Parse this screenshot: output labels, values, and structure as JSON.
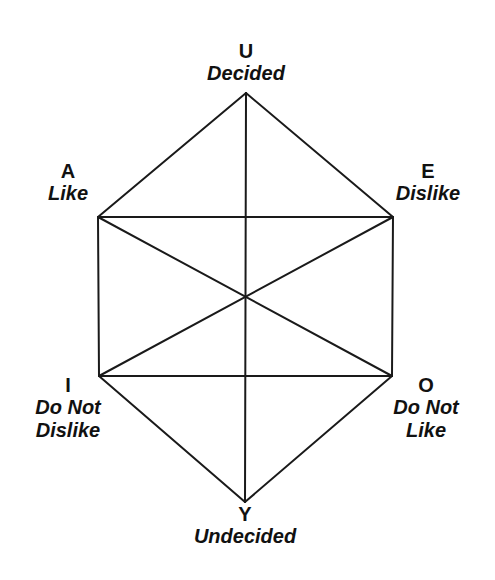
{
  "diagram": {
    "type": "hexagon of opposition",
    "line_color": "#1a1a1a",
    "background": "#ffffff",
    "vertices": {
      "U": {
        "letter": "U",
        "meaning": "Decided",
        "x": 246,
        "y": 93
      },
      "A": {
        "letter": "A",
        "meaning": "Like",
        "x": 98,
        "y": 217
      },
      "E": {
        "letter": "E",
        "meaning": "Dislike",
        "x": 393,
        "y": 217
      },
      "I": {
        "letter": "I",
        "meaning_line1": "Do Not",
        "meaning_line2": "Dislike",
        "x": 99,
        "y": 376
      },
      "O": {
        "letter": "O",
        "meaning_line1": "Do Not",
        "meaning_line2": "Like",
        "x": 392,
        "y": 376
      },
      "Y": {
        "letter": "Y",
        "meaning": "Undecided",
        "x": 245,
        "y": 502
      }
    },
    "center": {
      "x": 245,
      "y": 297
    },
    "edges": [
      [
        "U",
        "A"
      ],
      [
        "U",
        "E"
      ],
      [
        "A",
        "I"
      ],
      [
        "E",
        "O"
      ],
      [
        "I",
        "Y"
      ],
      [
        "O",
        "Y"
      ],
      [
        "A",
        "E"
      ],
      [
        "I",
        "O"
      ],
      [
        "U",
        "Y"
      ],
      [
        "A",
        "O"
      ],
      [
        "E",
        "I"
      ]
    ]
  }
}
